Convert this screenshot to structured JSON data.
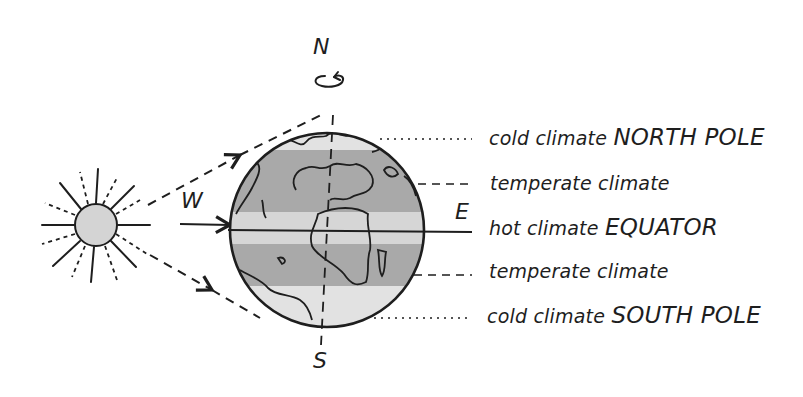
{
  "diagram": {
    "type": "earth-climate-zones",
    "directions": {
      "north": "N",
      "south": "S",
      "west": "W",
      "east": "E"
    },
    "zones": [
      {
        "id": "north-pole",
        "prefix": "cold climate",
        "name": "NORTH POLE",
        "leader": "dotted"
      },
      {
        "id": "north-temperate",
        "prefix": "temperate climate",
        "name": "",
        "leader": "dashed"
      },
      {
        "id": "equator",
        "prefix": "hot climate",
        "name": "EQUATOR",
        "leader": "solid"
      },
      {
        "id": "south-temperate",
        "prefix": "temperate climate",
        "name": "",
        "leader": "dashed"
      },
      {
        "id": "south-pole",
        "prefix": "cold climate",
        "name": "SOUTH POLE",
        "leader": "dotted"
      }
    ],
    "elements": [
      "sun",
      "sun-rays",
      "earth-globe",
      "rotation-arrow",
      "axis",
      "sunlight-arrows"
    ],
    "colors": {
      "stroke": "#1e1e1e",
      "cold_zone": "#e2e2e2",
      "temperate_zone": "#a9a9a9",
      "hot_zone": "#d6d6d6",
      "sun_fill": "#d4d4d4"
    }
  }
}
